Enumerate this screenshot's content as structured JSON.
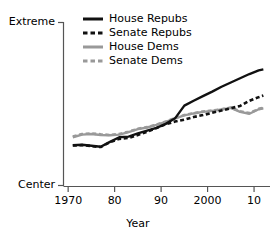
{
  "chart_data": {
    "type": "line",
    "title": "",
    "xlabel": "Year",
    "ylabel": "",
    "grid": false,
    "legend_position": "top-center",
    "x_tick_labels": [
      "1970",
      "80",
      "90",
      "2000",
      "10"
    ],
    "x_tick_values": [
      1970,
      1980,
      1990,
      2000,
      2010
    ],
    "y_tick_labels": [
      "Extreme",
      "Center"
    ],
    "y_tick_values": [
      1.0,
      0.0
    ],
    "xlim": [
      1969,
      2013
    ],
    "ylim": [
      0.0,
      1.0
    ],
    "colors": {
      "black": "#111111",
      "gray": "#999999",
      "axis": "#555555"
    },
    "x": [
      1971,
      1973,
      1975,
      1977,
      1979,
      1981,
      1983,
      1985,
      1987,
      1989,
      1991,
      1993,
      1995,
      1997,
      1999,
      2001,
      2003,
      2005,
      2007,
      2009,
      2011,
      2012
    ],
    "series": [
      {
        "name": "House Repubs",
        "style": "solid",
        "color": "#111111",
        "values": [
          0.247,
          0.25,
          0.244,
          0.238,
          0.268,
          0.296,
          0.3,
          0.32,
          0.337,
          0.354,
          0.378,
          0.412,
          0.49,
          0.52,
          0.548,
          0.576,
          0.606,
          0.632,
          0.658,
          0.684,
          0.706,
          0.712
        ]
      },
      {
        "name": "Senate Repubs",
        "style": "dashed",
        "color": "#111111",
        "values": [
          0.245,
          0.248,
          0.242,
          0.236,
          0.266,
          0.286,
          0.292,
          0.31,
          0.33,
          0.352,
          0.376,
          0.392,
          0.404,
          0.42,
          0.432,
          0.446,
          0.46,
          0.474,
          0.488,
          0.52,
          0.542,
          0.552
        ]
      },
      {
        "name": "House Dems",
        "style": "solid",
        "color": "#999999",
        "values": [
          0.296,
          0.312,
          0.316,
          0.31,
          0.308,
          0.312,
          0.328,
          0.346,
          0.356,
          0.372,
          0.39,
          0.412,
          0.43,
          0.442,
          0.452,
          0.458,
          0.466,
          0.476,
          0.452,
          0.44,
          0.468,
          0.474
        ]
      },
      {
        "name": "Senate Dems",
        "style": "dashed",
        "color": "#999999",
        "values": [
          0.3,
          0.316,
          0.32,
          0.314,
          0.31,
          0.316,
          0.33,
          0.348,
          0.358,
          0.374,
          0.392,
          0.414,
          0.432,
          0.444,
          0.454,
          0.46,
          0.468,
          0.478,
          0.456,
          0.444,
          0.47,
          0.476
        ]
      }
    ]
  },
  "axes": {
    "x_title": "Year",
    "y_top_label": "Extreme",
    "y_bottom_label": "Center",
    "x_ticks": [
      {
        "label": "1970"
      },
      {
        "label": "80"
      },
      {
        "label": "90"
      },
      {
        "label": "2000"
      },
      {
        "label": "10"
      }
    ]
  },
  "legend": {
    "items": [
      {
        "label": "House Repubs",
        "color": "#111111",
        "style": "solid"
      },
      {
        "label": "Senate Repubs",
        "color": "#111111",
        "style": "dashed"
      },
      {
        "label": "House Dems",
        "color": "#999999",
        "style": "solid"
      },
      {
        "label": "Senate Dems",
        "color": "#999999",
        "style": "dashed"
      }
    ]
  }
}
